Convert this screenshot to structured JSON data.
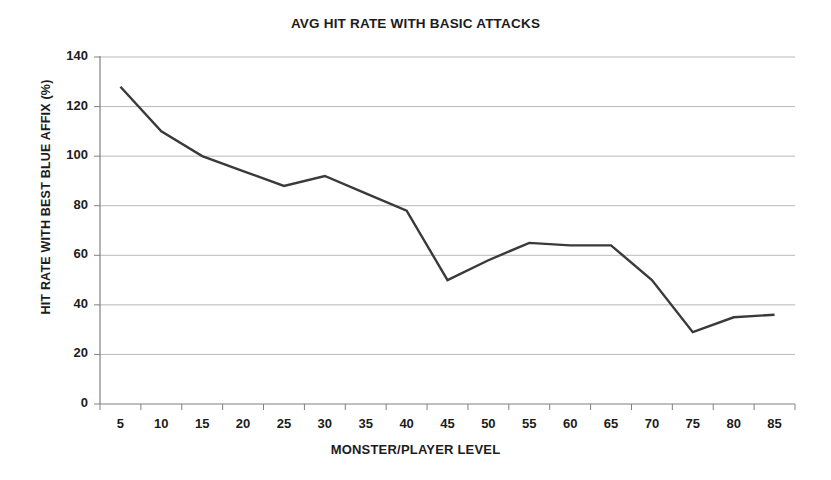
{
  "chart_data": {
    "type": "line",
    "title": "AVG HIT RATE WITH BASIC ATTACKS",
    "xlabel": "MONSTER/PLAYER LEVEL",
    "ylabel": "HIT RATE WITH BEST BLUE AFFIX (%)",
    "categories": [
      "5",
      "10",
      "15",
      "20",
      "25",
      "30",
      "35",
      "40",
      "45",
      "50",
      "55",
      "60",
      "65",
      "70",
      "75",
      "80",
      "85"
    ],
    "values": [
      128,
      110,
      100,
      94,
      88,
      92,
      85,
      78,
      50,
      58,
      65,
      64,
      64,
      50,
      29,
      35,
      36
    ],
    "series": [
      {
        "name": "Avg hit rate",
        "values": [
          128,
          110,
          100,
          94,
          88,
          92,
          85,
          78,
          50,
          58,
          65,
          64,
          64,
          50,
          29,
          35,
          36
        ],
        "color": "#3a3a3a"
      }
    ],
    "ylim": [
      0,
      140
    ],
    "ytick_labels": [
      "0",
      "20",
      "40",
      "60",
      "80",
      "100",
      "120",
      "140"
    ],
    "ytick_values": [
      0,
      20,
      40,
      60,
      80,
      100,
      120,
      140
    ],
    "grid": "horizontal",
    "legend": "none",
    "markers": "none",
    "line_color": "#3a3a3a",
    "grid_color": "#b8b8b8",
    "axis_color": "#808080",
    "background": "#ffffff"
  }
}
